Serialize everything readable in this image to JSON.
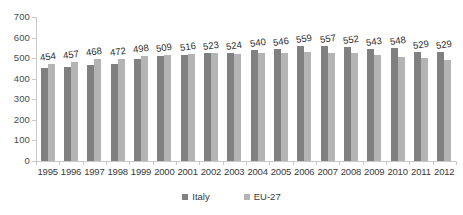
{
  "chart_data": {
    "type": "bar",
    "title": "",
    "subtitle": "",
    "xlabel": "",
    "ylabel": "",
    "ylim": [
      0,
      700
    ],
    "yticks": [
      0,
      100,
      200,
      300,
      400,
      500,
      600,
      700
    ],
    "grid": false,
    "legend_position": "bottom",
    "categories": [
      "1995",
      "1996",
      "1997",
      "1998",
      "1999",
      "2000",
      "2001",
      "2002",
      "2003",
      "2004",
      "2005",
      "2006",
      "2007",
      "2008",
      "2009",
      "2010",
      "2011",
      "2012"
    ],
    "series": [
      {
        "name": "Italy",
        "color": "#808080",
        "labels_shown": true,
        "values": [
          454,
          457,
          468,
          472,
          498,
          509,
          516,
          523,
          524,
          540,
          546,
          559,
          557,
          552,
          543,
          548,
          529,
          529
        ]
      },
      {
        "name": "EU-27",
        "color": "#b4b4b4",
        "labels_shown": false,
        "values": [
          472,
          482,
          497,
          498,
          510,
          517,
          521,
          523,
          520,
          524,
          525,
          528,
          527,
          523,
          513,
          508,
          500,
          493
        ]
      }
    ],
    "data_labels": [
      "454",
      "457",
      "468",
      "472",
      "498",
      "509",
      "516",
      "523",
      "524",
      "540",
      "546",
      "559",
      "557",
      "552",
      "543",
      "548",
      "529",
      "529"
    ]
  },
  "legend": {
    "items": [
      {
        "label": "Italy",
        "marker": "square-marker"
      },
      {
        "label": "EU-27",
        "marker": "square-marker"
      }
    ]
  }
}
